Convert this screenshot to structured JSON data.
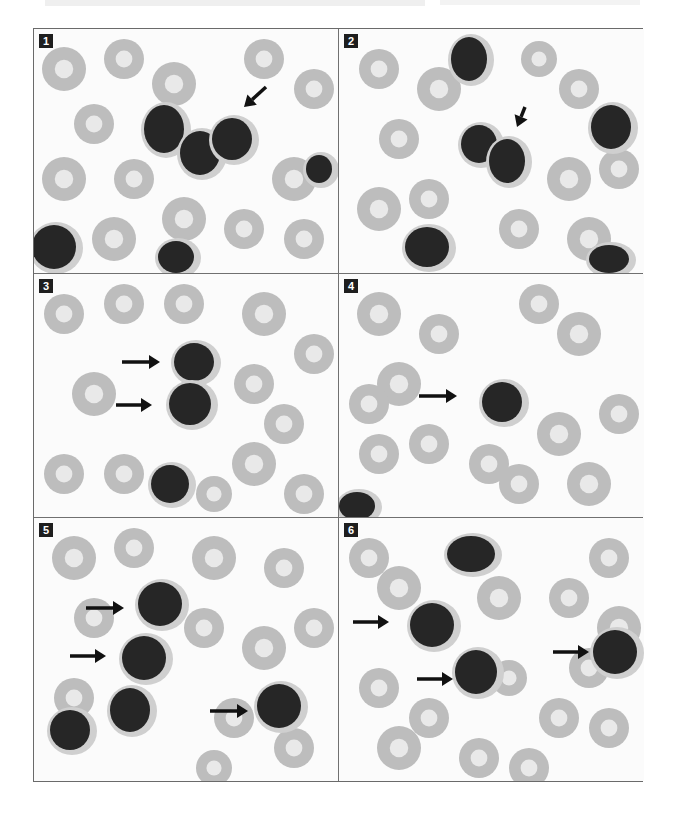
{
  "figure": {
    "panel_count": 6,
    "colors": {
      "rbc": "#bdbdbd",
      "rbc_center": "#e9e9e9",
      "nucleus": "#262626",
      "cytoplasm": "#cfcfcf",
      "arrow": "#111111",
      "border": "#6a6a6a"
    },
    "panels": [
      {
        "label": "1",
        "x": 0,
        "y": 0,
        "w": 304,
        "h": 244,
        "rbcs": [
          [
            30,
            40,
            22
          ],
          [
            90,
            30,
            20
          ],
          [
            140,
            55,
            22
          ],
          [
            60,
            95,
            20
          ],
          [
            30,
            150,
            22
          ],
          [
            100,
            150,
            20
          ],
          [
            150,
            190,
            22
          ],
          [
            210,
            200,
            20
          ],
          [
            260,
            150,
            22
          ],
          [
            280,
            60,
            20
          ],
          [
            230,
            30,
            20
          ],
          [
            270,
            210,
            20
          ],
          [
            80,
            210,
            22
          ],
          [
            200,
            110,
            18
          ]
        ],
        "cells": [
          [
            130,
            100,
            20,
            24
          ],
          [
            166,
            124,
            20,
            22
          ],
          [
            198,
            110,
            20,
            21
          ],
          [
            285,
            140,
            13,
            14
          ],
          [
            20,
            218,
            22,
            22
          ],
          [
            142,
            228,
            18,
            16
          ]
        ],
        "arrows": [
          [
            232,
            58,
            210,
            78
          ]
        ]
      },
      {
        "label": "2",
        "x": 305,
        "y": 0,
        "w": 305,
        "h": 244,
        "rbcs": [
          [
            40,
            40,
            20
          ],
          [
            100,
            60,
            22
          ],
          [
            60,
            110,
            20
          ],
          [
            40,
            180,
            22
          ],
          [
            240,
            60,
            20
          ],
          [
            280,
            140,
            20
          ],
          [
            230,
            150,
            22
          ],
          [
            180,
            200,
            20
          ],
          [
            250,
            210,
            22
          ],
          [
            90,
            170,
            20
          ],
          [
            200,
            30,
            18
          ]
        ],
        "cells": [
          [
            130,
            30,
            18,
            22
          ],
          [
            140,
            115,
            18,
            19
          ],
          [
            168,
            132,
            18,
            22
          ],
          [
            272,
            98,
            20,
            22
          ],
          [
            88,
            218,
            22,
            20
          ],
          [
            270,
            230,
            20,
            14
          ]
        ],
        "arrows": [
          [
            186,
            78,
            178,
            98
          ]
        ]
      },
      {
        "label": "3",
        "x": 0,
        "y": 245,
        "w": 304,
        "h": 243,
        "rbcs": [
          [
            30,
            40,
            20
          ],
          [
            90,
            30,
            20
          ],
          [
            150,
            30,
            20
          ],
          [
            230,
            40,
            22
          ],
          [
            280,
            80,
            20
          ],
          [
            220,
            110,
            20
          ],
          [
            60,
            120,
            22
          ],
          [
            30,
            200,
            20
          ],
          [
            90,
            200,
            20
          ],
          [
            220,
            190,
            22
          ],
          [
            270,
            220,
            20
          ],
          [
            250,
            150,
            20
          ],
          [
            180,
            220,
            18
          ]
        ],
        "cells": [
          [
            160,
            88,
            20,
            19
          ],
          [
            156,
            130,
            21,
            21
          ],
          [
            136,
            210,
            19,
            19
          ]
        ],
        "arrows": [
          [
            88,
            88,
            126,
            88
          ],
          [
            82,
            131,
            118,
            131
          ]
        ]
      },
      {
        "label": "4",
        "x": 305,
        "y": 245,
        "w": 305,
        "h": 243,
        "rbcs": [
          [
            40,
            40,
            22
          ],
          [
            100,
            60,
            20
          ],
          [
            60,
            110,
            22
          ],
          [
            40,
            180,
            20
          ],
          [
            240,
            60,
            22
          ],
          [
            280,
            140,
            20
          ],
          [
            220,
            160,
            22
          ],
          [
            180,
            210,
            20
          ],
          [
            250,
            210,
            22
          ],
          [
            90,
            170,
            20
          ],
          [
            200,
            30,
            20
          ],
          [
            150,
            190,
            20
          ],
          [
            30,
            130,
            20
          ]
        ],
        "cells": [
          [
            163,
            128,
            20,
            20
          ],
          [
            18,
            232,
            18,
            14
          ]
        ],
        "arrows": [
          [
            80,
            122,
            118,
            122
          ]
        ]
      },
      {
        "label": "5",
        "x": 0,
        "y": 489,
        "w": 304,
        "h": 263,
        "rbcs": [
          [
            40,
            40,
            22
          ],
          [
            100,
            30,
            20
          ],
          [
            180,
            40,
            22
          ],
          [
            250,
            50,
            20
          ],
          [
            280,
            110,
            20
          ],
          [
            230,
            130,
            22
          ],
          [
            200,
            200,
            20
          ],
          [
            260,
            230,
            20
          ],
          [
            60,
            100,
            20
          ],
          [
            40,
            180,
            20
          ],
          [
            170,
            110,
            20
          ],
          [
            180,
            250,
            18
          ]
        ],
        "cells": [
          [
            126,
            86,
            22,
            22
          ],
          [
            110,
            140,
            22,
            22
          ],
          [
            96,
            192,
            20,
            22
          ],
          [
            36,
            212,
            20,
            20
          ],
          [
            245,
            188,
            22,
            22
          ]
        ],
        "arrows": [
          [
            52,
            90,
            90,
            90
          ],
          [
            36,
            138,
            72,
            138
          ],
          [
            176,
            193,
            214,
            193
          ]
        ]
      },
      {
        "label": "6",
        "x": 305,
        "y": 489,
        "w": 305,
        "h": 263,
        "rbcs": [
          [
            30,
            40,
            20
          ],
          [
            60,
            70,
            22
          ],
          [
            160,
            80,
            22
          ],
          [
            230,
            80,
            20
          ],
          [
            270,
            40,
            20
          ],
          [
            280,
            110,
            22
          ],
          [
            250,
            150,
            20
          ],
          [
            220,
            200,
            20
          ],
          [
            190,
            250,
            20
          ],
          [
            40,
            170,
            20
          ],
          [
            90,
            200,
            20
          ],
          [
            60,
            230,
            22
          ],
          [
            140,
            240,
            20
          ],
          [
            270,
            210,
            20
          ],
          [
            170,
            160,
            18
          ]
        ],
        "cells": [
          [
            132,
            36,
            24,
            18
          ],
          [
            93,
            107,
            22,
            22
          ],
          [
            137,
            154,
            21,
            22
          ],
          [
            276,
            134,
            22,
            22
          ]
        ],
        "arrows": [
          [
            14,
            104,
            50,
            104
          ],
          [
            78,
            161,
            114,
            161
          ],
          [
            214,
            134,
            250,
            134
          ]
        ]
      }
    ]
  }
}
